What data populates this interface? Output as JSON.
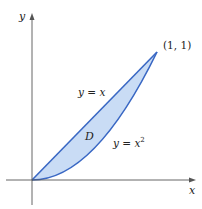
{
  "diagram": {
    "axes": {
      "x_label": "x",
      "y_label": "y"
    },
    "point_label": "(1, 1)",
    "curve_line_label": "y = x",
    "curve_parabola_label_base": "y = x",
    "curve_parabola_exponent": "2",
    "region_label": "D",
    "colors": {
      "region_fill": "#c9dcf5",
      "curve_stroke": "#3a68c4",
      "axis": "#555555"
    }
  }
}
